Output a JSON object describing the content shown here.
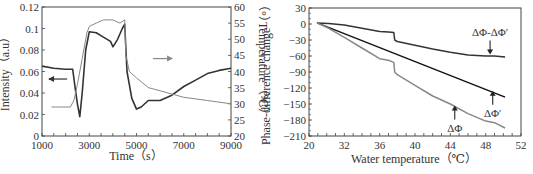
{
  "chart_data": [
    {
      "type": "line",
      "title": "",
      "xlabel": "Time（s）",
      "ylabel": "Intensity（a.u）",
      "y2label": "Temperature（℃）",
      "xlim": [
        1000,
        9000
      ],
      "ylim": [
        0,
        0.12
      ],
      "y2lim": [
        20,
        60
      ],
      "xticks": [
        1000,
        3000,
        5000,
        7000,
        9000
      ],
      "yticks": [
        "0",
        "0.02",
        "0.04",
        "0.06",
        "0.08",
        "0.1",
        "0.12"
      ],
      "y2ticks": [
        "20",
        "25",
        "30",
        "35",
        "40",
        "45",
        "50",
        "55",
        "60"
      ],
      "grid": false,
      "series": [
        {
          "name": "Intensity",
          "axis": "left",
          "color": "#333333",
          "x": [
            1000,
            1500,
            2000,
            2300,
            2400,
            2500,
            2600,
            2700,
            2850,
            3000,
            3300,
            3600,
            3900,
            4000,
            4200,
            4400,
            4500,
            4600,
            4800,
            5000,
            5200,
            5500,
            6000,
            6500,
            7000,
            7500,
            8000,
            8500,
            9000
          ],
          "values": [
            0.065,
            0.063,
            0.062,
            0.062,
            0.045,
            0.03,
            0.018,
            0.04,
            0.08,
            0.097,
            0.096,
            0.092,
            0.088,
            0.083,
            0.09,
            0.1,
            0.104,
            0.06,
            0.035,
            0.025,
            0.027,
            0.033,
            0.033,
            0.038,
            0.046,
            0.052,
            0.058,
            0.061,
            0.063
          ]
        },
        {
          "name": "Temperature",
          "axis": "right",
          "color": "#888888",
          "x": [
            1400,
            2200,
            2350,
            2500,
            2700,
            2900,
            3000,
            3300,
            3600,
            4000,
            4300,
            4500,
            4550,
            4700,
            5000,
            5500,
            6000,
            7000,
            8000,
            9000
          ],
          "values": [
            29,
            29,
            31,
            36,
            44,
            52,
            54,
            55,
            56,
            56,
            55,
            56,
            45,
            40,
            38,
            35,
            34,
            32,
            31,
            30
          ]
        }
      ],
      "annotations": [
        {
          "type": "arrow",
          "direction": "left",
          "target": "Intensity",
          "x": 1300,
          "y": 0.053
        },
        {
          "type": "arrow",
          "direction": "right",
          "target": "Temperature",
          "x": 5700,
          "y2": 44
        }
      ]
    },
    {
      "type": "line",
      "title": "",
      "xlabel": "Water temperature（℃）",
      "ylabel": "Phase-difference change（°）",
      "xticks": [
        "20",
        "32",
        "36",
        "40",
        "44",
        "48",
        "52"
      ],
      "ylim": [
        -210,
        30
      ],
      "yticks": [
        "30",
        "0",
        "-30",
        "-60",
        "-90",
        "-120",
        "-150",
        "-180",
        "-210"
      ],
      "grid": false,
      "series": [
        {
          "name": "ΔΦ-ΔΦ′",
          "color": "#333333",
          "x": [
            28.5,
            30,
            32,
            34,
            36,
            37,
            37.6,
            37.7,
            38,
            40,
            42,
            44,
            46,
            48,
            49,
            50.2
          ],
          "values": [
            2,
            1,
            -2,
            -8,
            -14,
            -15,
            -16,
            -30,
            -33,
            -40,
            -47,
            -53,
            -58,
            -60,
            -60,
            -62
          ]
        },
        {
          "name": "ΔΦ′",
          "color": "#111111",
          "x": [
            28.5,
            50.2
          ],
          "values": [
            2,
            -137
          ]
        },
        {
          "name": "ΔΦ",
          "color": "#888888",
          "x": [
            28.5,
            30,
            32,
            34,
            36,
            37,
            37.6,
            37.7,
            38,
            40,
            42,
            44,
            46,
            48,
            49,
            50.2
          ],
          "values": [
            2,
            -8,
            -25,
            -45,
            -65,
            -68,
            -72,
            -90,
            -95,
            -115,
            -135,
            -150,
            -168,
            -182,
            -185,
            -195
          ]
        }
      ],
      "annotations": [
        {
          "text": "ΔΦ-ΔΦ′",
          "arrow": "down",
          "x": 48.5,
          "y": -57
        },
        {
          "text": "ΔΦ′",
          "arrow": "up",
          "x": 48.8,
          "y": -125
        },
        {
          "text": "ΔΦ",
          "arrow": "up",
          "x": 44.5,
          "y": -153
        }
      ]
    }
  ]
}
